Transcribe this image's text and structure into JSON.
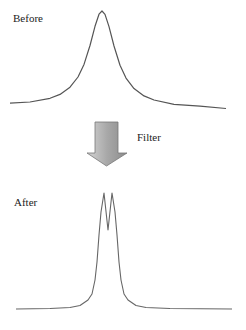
{
  "labels": {
    "before": "Before",
    "filter": "Filter",
    "after": "After"
  },
  "colors": {
    "curve": "#555555",
    "arrow_fill_light": "#c8c8c8",
    "arrow_fill_dark": "#8a8a8a",
    "arrow_stroke": "#777777"
  },
  "curves": {
    "before_points": "10,103.2 30,102 50,98.3 60,94.4 70,87.2 78,77 84,64.4 90,45.5 95,26.3 99,14.2 102,11 105,14.4 109,26.6 114,46 120,65.2 126,78.1 134,88.6 144,95.9 154,100 174,104.3 200,106.2 226,108.5",
    "after_points": "16,309 50,308.5 70,307.5 80,305.5 88,300 92,294 95,280 97,262 99,235 101,212 104,193 108,230 112,193 115,212 117,235 119,262 121,280 124,294 128,300 136,305.5 146,307.5 170,308.5 232,309"
  }
}
